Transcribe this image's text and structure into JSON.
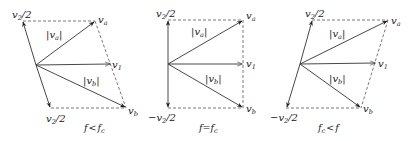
{
  "figure": {
    "colors": {
      "vector": "#333333",
      "dashed": "#555555",
      "text": "#222222",
      "background": "#ffffff"
    },
    "panels": [
      {
        "id": "f-less-fc",
        "caption": {
          "main": "f",
          "rel": "<",
          "rhs": "f",
          "rhs_sub": "c"
        },
        "labels": {
          "top_left": {
            "main": "v",
            "sub": "2",
            "tail": "/2"
          },
          "bottom_left": {
            "prefix": "",
            "main": "v",
            "sub": "2",
            "tail": "/2"
          },
          "va": {
            "main": "v",
            "sub": "a"
          },
          "v1": {
            "main": "v",
            "sub": "1"
          },
          "vb": {
            "main": "v",
            "sub": "b"
          },
          "mag_a": {
            "open": "|",
            "main": "v",
            "sub": "a",
            "close": "|"
          },
          "mag_b": {
            "open": "|",
            "main": "v",
            "sub": "b",
            "close": "|"
          }
        }
      },
      {
        "id": "f-equal-fc",
        "caption": {
          "main": "f",
          "rel": "=",
          "rhs": "f",
          "rhs_sub": "c"
        },
        "labels": {
          "top_left": {
            "main": "v",
            "sub": "2",
            "tail": "/2"
          },
          "bottom_left": {
            "prefix": "−",
            "main": "v",
            "sub": "2",
            "tail": "/2"
          },
          "va": {
            "main": "v",
            "sub": "a"
          },
          "v1": {
            "main": "v",
            "sub": "1"
          },
          "vb": {
            "main": "v",
            "sub": "b"
          },
          "mag_a": {
            "open": "|",
            "main": "v",
            "sub": "a",
            "close": "|"
          },
          "mag_b": {
            "open": "|",
            "main": "v",
            "sub": "b",
            "close": "|"
          }
        }
      },
      {
        "id": "fc-less-f",
        "caption": {
          "main": "f",
          "main_sub": "c",
          "rel": "<",
          "rhs": "f"
        },
        "labels": {
          "top_left": {
            "main": "v",
            "sub": "2",
            "tail": "/2"
          },
          "bottom_left": {
            "prefix": "−",
            "main": "v",
            "sub": "2",
            "tail": "/2"
          },
          "va": {
            "main": "v",
            "sub": "a"
          },
          "v1": {
            "main": "v",
            "sub": "1"
          },
          "vb": {
            "main": "v",
            "sub": "b"
          },
          "mag_a": {
            "open": "|",
            "main": "v",
            "sub": "a",
            "close": "|"
          },
          "mag_b": {
            "open": "|",
            "main": "v",
            "sub": "b",
            "close": "|"
          }
        }
      }
    ]
  }
}
